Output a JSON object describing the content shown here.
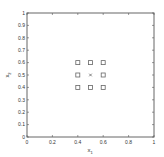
{
  "chart_data": {
    "type": "scatter",
    "title": "",
    "xlabel": "x1",
    "ylabel": "x2",
    "xlim": [
      0,
      1
    ],
    "ylim": [
      0,
      1
    ],
    "grid": false,
    "x_ticks": [
      "0",
      "0.2",
      "0.4",
      "0.6",
      "0.8",
      "1"
    ],
    "y_ticks": [
      "0",
      "0.1",
      "0.2",
      "0.3",
      "0.4",
      "0.5",
      "0.6",
      "0.7",
      "0.8",
      "0.9",
      "1"
    ],
    "series": [
      {
        "name": "square-markers",
        "marker": "square",
        "points": [
          [
            0.4,
            0.6
          ],
          [
            0.5,
            0.6
          ],
          [
            0.6,
            0.6
          ],
          [
            0.4,
            0.5
          ],
          [
            0.6,
            0.5
          ],
          [
            0.4,
            0.4
          ],
          [
            0.5,
            0.4
          ],
          [
            0.6,
            0.4
          ]
        ]
      },
      {
        "name": "center-marker",
        "marker": "x",
        "points": [
          [
            0.5,
            0.5
          ]
        ]
      }
    ],
    "legend": null
  },
  "axes": {
    "xlabel_main": "x",
    "xlabel_sub": "1",
    "ylabel_main": "x",
    "ylabel_sub": "2"
  },
  "colors": {
    "axis": "#555555",
    "marker": "#666666"
  }
}
